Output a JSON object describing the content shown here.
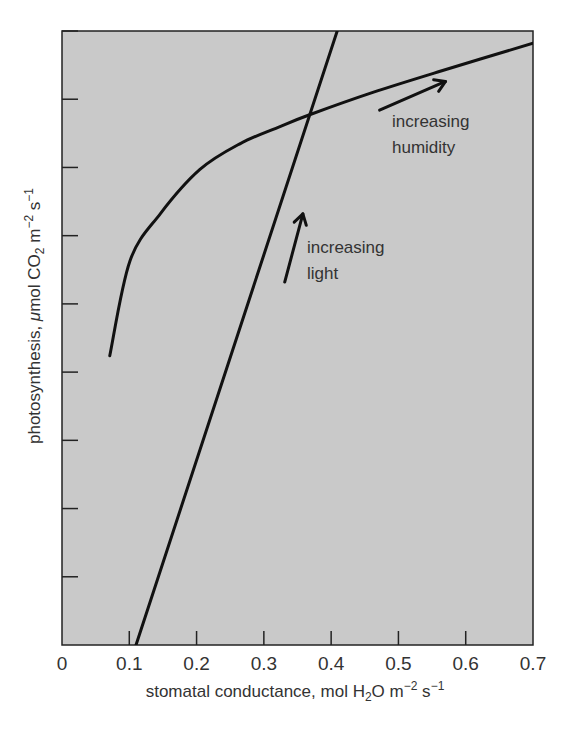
{
  "chart_data": {
    "type": "line",
    "title": "",
    "xlabel": "stomatal conductance, mol H2O m-2 s-1",
    "xlabel_parts": {
      "pre": "stomatal conductance, mol H",
      "sub": "2",
      "mid": "O m",
      "sup1": "−2",
      "mid2": " s",
      "sup2": "−1"
    },
    "ylabel": "photosynthesis, μmol CO2 m-2 s-1",
    "ylabel_parts": {
      "pre": "photosynthesis, ",
      "mu": "μ",
      "mid": "mol CO",
      "sub": "2",
      "mid2": " m",
      "sup1": "−2",
      "mid3": " s",
      "sup2": "−1"
    },
    "xlim": [
      0,
      0.7
    ],
    "ylim": [
      0,
      9
    ],
    "x_ticks": [
      0,
      0.1,
      0.2,
      0.3,
      0.4,
      0.5,
      0.6,
      0.7
    ],
    "x_tick_labels": [
      "0",
      "0.1",
      "0.2",
      "0.3",
      "0.4",
      "0.5",
      "0.6",
      "0.7"
    ],
    "y_ticks": [
      1,
      2,
      3,
      4,
      5,
      6,
      7,
      8,
      9
    ],
    "y_tick_labels": [],
    "grid": false,
    "legend": null,
    "series": [
      {
        "name": "humidity response curve",
        "x": [
          0.071,
          0.101,
          0.146,
          0.205,
          0.265,
          0.324,
          0.37,
          0.462,
          0.562,
          0.7
        ],
        "y": [
          4.24,
          5.63,
          6.32,
          6.97,
          7.35,
          7.6,
          7.78,
          8.1,
          8.41,
          8.82
        ]
      },
      {
        "name": "light response line",
        "x": [
          0.11,
          0.409
        ],
        "y": [
          0,
          9
        ]
      }
    ],
    "annotations": [
      {
        "text_lines": [
          "increasing",
          "humidity"
        ],
        "arrow_from": [
          0.472,
          7.84
        ],
        "arrow_to": [
          0.57,
          8.26
        ]
      },
      {
        "text_lines": [
          "increasing",
          "light"
        ],
        "arrow_from": [
          0.331,
          5.32
        ],
        "arrow_to": [
          0.358,
          6.32
        ]
      }
    ],
    "colors": {
      "plot_background": "#c9c9c9",
      "line": "#111111",
      "page_background": "#ffffff"
    }
  }
}
